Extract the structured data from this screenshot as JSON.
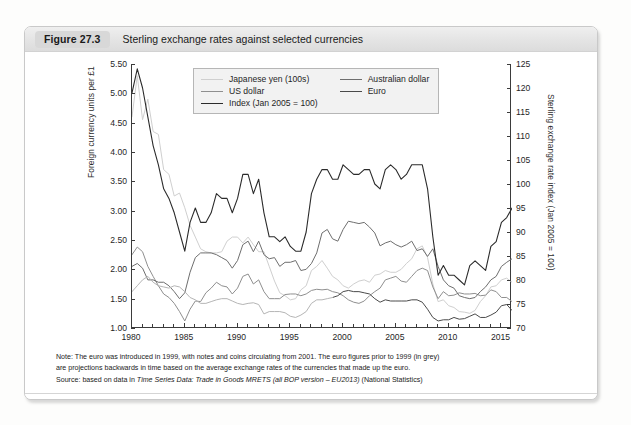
{
  "figure": {
    "badge": "Figure 27.3",
    "title": "Sterling exchange rates against selected currencies"
  },
  "notes": {
    "note_line1": "Note: The euro was introduced in 1999, with notes and coins circulating from 2001. The euro figures prior to 1999 (in grey)",
    "note_line2": "are projections backwards in time based on the average exchange rates of the currencies that made up the euro.",
    "source_prefix": "Source: based on data in ",
    "source_italic": "Time Series Data: Trade in Goods MRETS (all BOP version – EU2013)",
    "source_suffix": " (National Statistics)"
  },
  "chart_data": {
    "type": "line",
    "title": "Sterling exchange rates against selected currencies",
    "xlabel": "",
    "ylabel": "Foreign currency units per £1",
    "y2label": "Sterling exchange rate index (Jan 2005 = 100)",
    "xlim": [
      1980,
      2016
    ],
    "ylim": [
      1.0,
      5.5
    ],
    "y2lim": [
      70,
      125
    ],
    "grid": false,
    "legend_position": "top-center",
    "xticks_major": [
      1980,
      1985,
      1990,
      1995,
      2000,
      2005,
      2010,
      2015
    ],
    "xticks_minor_step": 1,
    "yticks_left": [
      "1.00",
      "1.50",
      "2.00",
      "2.50",
      "3.00",
      "3.50",
      "4.00",
      "4.50",
      "5.00",
      "5.50"
    ],
    "yticks_right": [
      "70",
      "75",
      "80",
      "85",
      "90",
      "95",
      "100",
      "105",
      "110",
      "115",
      "120",
      "125"
    ],
    "colors": {
      "japanese_yen": "#cfcfcf",
      "us_dollar": "#8f8f8f",
      "index": "#2b2b2b",
      "australian_dollar": "#6e6e6e",
      "euro": "#4a4a4a",
      "euro_projected": "#b5b5b5"
    },
    "series": [
      {
        "name": "Japanese yen (100s)",
        "axis": "left",
        "color": "#cfcfcf",
        "x": [
          1980,
          1980.5,
          1981,
          1981.5,
          1982,
          1982.5,
          1983,
          1983.5,
          1984,
          1984.5,
          1985,
          1985.5,
          1986,
          1986.5,
          1987,
          1987.5,
          1988,
          1988.5,
          1989,
          1989.5,
          1990,
          1990.5,
          1991,
          1991.5,
          1992,
          1992.5,
          1993,
          1993.5,
          1994,
          1994.5,
          1995,
          1995.5,
          1996,
          1996.5,
          1997,
          1997.5,
          1998,
          1998.5,
          1999,
          1999.5,
          2000,
          2000.5,
          2001,
          2001.5,
          2002,
          2002.5,
          2003,
          2003.5,
          2004,
          2004.5,
          2005,
          2005.5,
          2006,
          2006.5,
          2007,
          2007.5,
          2008,
          2008.5,
          2009,
          2009.5,
          2010,
          2010.5,
          2011,
          2011.5,
          2012,
          2012.5,
          2013,
          2013.5,
          2014,
          2014.5,
          2015,
          2015.5,
          2016
        ],
        "y": [
          4.6,
          5.3,
          4.55,
          4.9,
          4.35,
          4.3,
          3.7,
          3.62,
          3.25,
          3.3,
          3.05,
          2.75,
          2.55,
          2.35,
          2.3,
          2.28,
          2.28,
          2.3,
          2.48,
          2.55,
          2.55,
          2.45,
          2.55,
          2.42,
          2.3,
          2.3,
          2.05,
          1.8,
          1.6,
          1.55,
          1.48,
          1.5,
          1.65,
          1.72,
          1.98,
          2.05,
          2.15,
          2.02,
          1.88,
          1.82,
          1.72,
          1.68,
          1.75,
          1.8,
          1.82,
          1.78,
          1.9,
          1.92,
          1.98,
          1.95,
          1.95,
          2.0,
          2.1,
          2.18,
          2.35,
          2.4,
          2.2,
          1.75,
          1.45,
          1.48,
          1.38,
          1.35,
          1.28,
          1.27,
          1.25,
          1.3,
          1.45,
          1.55,
          1.7,
          1.72,
          1.82,
          1.85,
          1.78
        ]
      },
      {
        "name": "US dollar",
        "axis": "left",
        "color": "#8f8f8f",
        "x": [
          1980,
          1980.5,
          1981,
          1981.5,
          1982,
          1982.5,
          1983,
          1983.5,
          1984,
          1984.5,
          1985,
          1985.5,
          1986,
          1986.5,
          1987,
          1987.5,
          1988,
          1988.5,
          1989,
          1989.5,
          1990,
          1990.5,
          1991,
          1991.5,
          1992,
          1992.5,
          1993,
          1993.5,
          1994,
          1994.5,
          1995,
          1995.5,
          1996,
          1996.5,
          1997,
          1997.5,
          1998,
          1998.5,
          1999,
          1999.5,
          2000,
          2000.5,
          2001,
          2001.5,
          2002,
          2002.5,
          2003,
          2003.5,
          2004,
          2004.5,
          2005,
          2005.5,
          2006,
          2006.5,
          2007,
          2007.5,
          2008,
          2008.5,
          2009,
          2009.5,
          2010,
          2010.5,
          2011,
          2011.5,
          2012,
          2012.5,
          2013,
          2013.5,
          2014,
          2014.5,
          2015,
          2015.5,
          2016
        ],
        "y": [
          2.25,
          2.38,
          2.3,
          2.05,
          1.88,
          1.72,
          1.58,
          1.52,
          1.42,
          1.28,
          1.12,
          1.32,
          1.46,
          1.45,
          1.6,
          1.68,
          1.78,
          1.72,
          1.7,
          1.58,
          1.68,
          1.88,
          1.92,
          1.75,
          1.82,
          1.62,
          1.5,
          1.5,
          1.5,
          1.57,
          1.58,
          1.58,
          1.55,
          1.58,
          1.64,
          1.66,
          1.65,
          1.66,
          1.62,
          1.6,
          1.55,
          1.48,
          1.44,
          1.42,
          1.46,
          1.55,
          1.62,
          1.68,
          1.82,
          1.85,
          1.88,
          1.8,
          1.78,
          1.88,
          1.98,
          2.02,
          1.98,
          1.7,
          1.5,
          1.62,
          1.55,
          1.56,
          1.6,
          1.58,
          1.58,
          1.59,
          1.55,
          1.56,
          1.65,
          1.62,
          1.52,
          1.52,
          1.45
        ]
      },
      {
        "name": "Australian dollar",
        "axis": "left",
        "color": "#6e6e6e",
        "x": [
          1980,
          1980.5,
          1981,
          1981.5,
          1982,
          1982.5,
          1983,
          1983.5,
          1984,
          1984.5,
          1985,
          1985.5,
          1986,
          1986.5,
          1987,
          1987.5,
          1988,
          1988.5,
          1989,
          1989.5,
          1990,
          1990.5,
          1991,
          1991.5,
          1992,
          1992.5,
          1993,
          1993.5,
          1994,
          1994.5,
          1995,
          1995.5,
          1996,
          1996.5,
          1997,
          1997.5,
          1998,
          1998.5,
          1999,
          1999.5,
          2000,
          2000.5,
          2001,
          2001.5,
          2002,
          2002.5,
          2003,
          2003.5,
          2004,
          2004.5,
          2005,
          2005.5,
          2006,
          2006.5,
          2007,
          2007.5,
          2008,
          2008.5,
          2009,
          2009.5,
          2010,
          2010.5,
          2011,
          2011.5,
          2012,
          2012.5,
          2013,
          2013.5,
          2014,
          2014.5,
          2015,
          2015.5,
          2016
        ],
        "y": [
          2.05,
          2.1,
          2.02,
          1.82,
          1.82,
          1.78,
          1.78,
          1.72,
          1.62,
          1.5,
          1.6,
          1.95,
          2.2,
          2.28,
          2.28,
          2.28,
          2.25,
          2.2,
          2.15,
          2.02,
          2.15,
          2.42,
          2.48,
          2.3,
          2.48,
          2.25,
          2.18,
          2.2,
          2.05,
          2.12,
          2.12,
          2.15,
          1.98,
          2.0,
          2.1,
          2.28,
          2.62,
          2.68,
          2.52,
          2.48,
          2.68,
          2.82,
          2.8,
          2.78,
          2.8,
          2.72,
          2.62,
          2.4,
          2.45,
          2.48,
          2.42,
          2.38,
          2.42,
          2.48,
          2.32,
          2.35,
          2.22,
          2.35,
          2.05,
          1.82,
          1.72,
          1.68,
          1.55,
          1.52,
          1.5,
          1.52,
          1.62,
          1.7,
          1.82,
          1.88,
          2.05,
          2.12,
          2.18
        ]
      },
      {
        "name": "Euro",
        "axis": "left",
        "color": "#4a4a4a",
        "x": [
          1999,
          1999.5,
          2000,
          2000.5,
          2001,
          2001.5,
          2002,
          2002.5,
          2003,
          2003.5,
          2004,
          2004.5,
          2005,
          2005.5,
          2006,
          2006.5,
          2007,
          2007.5,
          2008,
          2008.5,
          2009,
          2009.5,
          2010,
          2010.5,
          2011,
          2011.5,
          2012,
          2012.5,
          2013,
          2013.5,
          2014,
          2014.5,
          2015,
          2015.5,
          2016
        ],
        "y": [
          1.52,
          1.55,
          1.62,
          1.64,
          1.62,
          1.62,
          1.6,
          1.58,
          1.5,
          1.44,
          1.48,
          1.46,
          1.46,
          1.46,
          1.46,
          1.48,
          1.48,
          1.44,
          1.32,
          1.18,
          1.12,
          1.14,
          1.14,
          1.18,
          1.15,
          1.16,
          1.2,
          1.24,
          1.18,
          1.18,
          1.22,
          1.27,
          1.38,
          1.4,
          1.3
        ]
      },
      {
        "name": "Euro (projected pre-1999)",
        "axis": "left",
        "color": "#b5b5b5",
        "x": [
          1980,
          1980.5,
          1981,
          1981.5,
          1982,
          1982.5,
          1983,
          1983.5,
          1984,
          1984.5,
          1985,
          1985.5,
          1986,
          1986.5,
          1987,
          1987.5,
          1988,
          1988.5,
          1989,
          1989.5,
          1990,
          1990.5,
          1991,
          1991.5,
          1992,
          1992.5,
          1993,
          1993.5,
          1994,
          1994.5,
          1995,
          1995.5,
          1996,
          1996.5,
          1997,
          1997.5,
          1998,
          1998.5,
          1999
        ],
        "y": [
          1.62,
          1.72,
          1.82,
          1.88,
          1.78,
          1.72,
          1.7,
          1.68,
          1.72,
          1.7,
          1.62,
          1.52,
          1.48,
          1.42,
          1.42,
          1.45,
          1.48,
          1.5,
          1.5,
          1.46,
          1.42,
          1.4,
          1.42,
          1.43,
          1.4,
          1.24,
          1.28,
          1.28,
          1.28,
          1.26,
          1.2,
          1.18,
          1.22,
          1.28,
          1.42,
          1.48,
          1.48,
          1.5,
          1.52
        ]
      },
      {
        "name": "Index (Jan 2005 = 100)",
        "axis": "right",
        "color": "#2b2b2b",
        "x": [
          1980,
          1980.5,
          1981,
          1981.5,
          1982,
          1982.5,
          1983,
          1983.5,
          1984,
          1984.5,
          1985,
          1985.5,
          1986,
          1986.5,
          1987,
          1987.5,
          1988,
          1988.5,
          1989,
          1989.5,
          1990,
          1990.5,
          1991,
          1991.5,
          1992,
          1992.5,
          1993,
          1993.5,
          1994,
          1994.5,
          1995,
          1995.5,
          1996,
          1996.5,
          1997,
          1997.5,
          1998,
          1998.5,
          1999,
          1999.5,
          2000,
          2000.5,
          2001,
          2001.5,
          2002,
          2002.5,
          2003,
          2003.5,
          2004,
          2004.5,
          2005,
          2005.5,
          2006,
          2006.5,
          2007,
          2007.5,
          2008,
          2008.5,
          2009,
          2009.5,
          2010,
          2010.5,
          2011,
          2011.5,
          2012,
          2012.5,
          2013,
          2013.5,
          2014,
          2014.5,
          2015,
          2015.5,
          2016
        ],
        "y": [
          119,
          124,
          120,
          114,
          108,
          104,
          99,
          97,
          94,
          90,
          86,
          92,
          95,
          92,
          92,
          94,
          98,
          97,
          97,
          94,
          97,
          102,
          102,
          98,
          101,
          94,
          89,
          89,
          88,
          89,
          87,
          86,
          86,
          90,
          98,
          101,
          103,
          103,
          101,
          101,
          104,
          103,
          102,
          102,
          103,
          103,
          100,
          99,
          103,
          104,
          103,
          101,
          102,
          104,
          104,
          104,
          99,
          89,
          81,
          83,
          81,
          81,
          80,
          79,
          83,
          84,
          83,
          82,
          87,
          88,
          92,
          93,
          95
        ]
      }
    ]
  },
  "legend": {
    "items": [
      {
        "label": "Japanese yen (100s)",
        "color": "#cfcfcf"
      },
      {
        "label": "Australian dollar",
        "color": "#6e6e6e"
      },
      {
        "label": "US dollar",
        "color": "#8f8f8f"
      },
      {
        "label": "Euro",
        "color": "#4a4a4a"
      },
      {
        "label": "Index (Jan 2005 = 100)",
        "color": "#2b2b2b"
      }
    ]
  }
}
